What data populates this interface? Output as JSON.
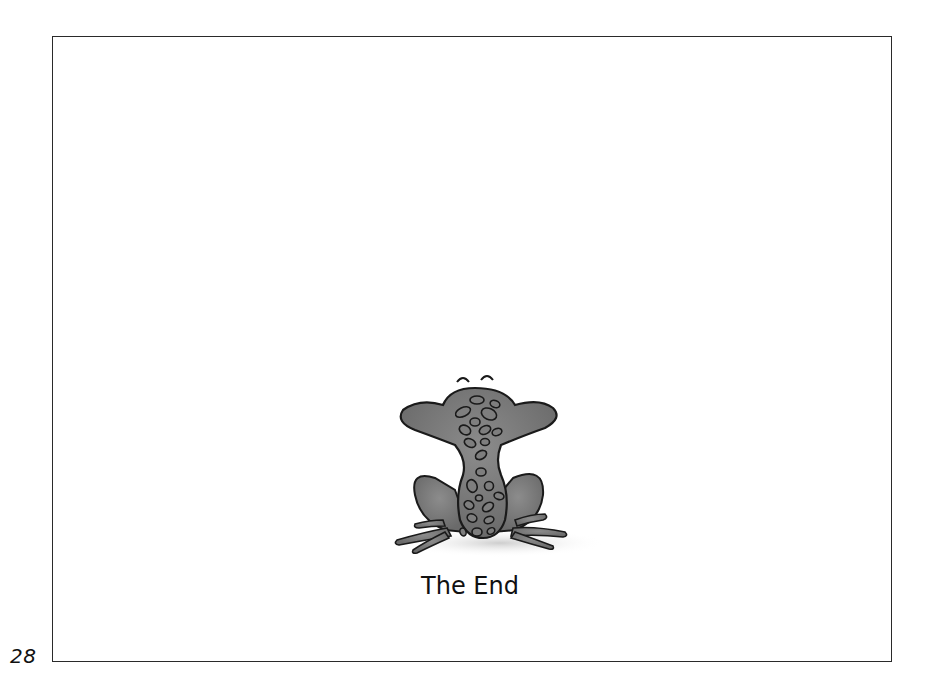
{
  "page": {
    "number": "28",
    "caption": "The End"
  },
  "illustration": {
    "subject": "frog-from-behind",
    "body_color": "#7a7a7a",
    "outline_color": "#1a1a1a",
    "shadow_color": "#d8d8d8"
  },
  "colors": {
    "background": "#ffffff",
    "frame_border": "#2a2a2a",
    "text": "#111111"
  }
}
